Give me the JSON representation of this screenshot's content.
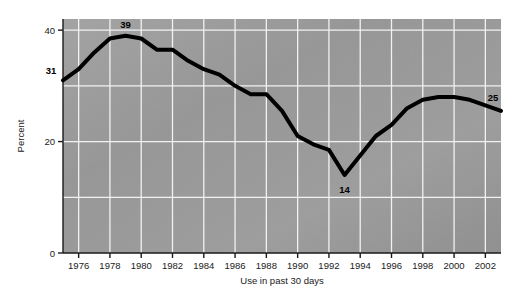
{
  "chart_data": {
    "type": "line",
    "title": "",
    "xlabel": "Use in past 30 days",
    "ylabel": "Percent",
    "xlim": [
      1975,
      2003
    ],
    "ylim": [
      0,
      42
    ],
    "ytick_labels": [
      "0",
      "20",
      "40"
    ],
    "yticks": [
      0,
      20,
      40
    ],
    "grid": true,
    "legend": false,
    "xtick_labels": [
      "1976",
      "1978",
      "1980",
      "1982",
      "1984",
      "1986",
      "1988",
      "1990",
      "1992",
      "1994",
      "1996",
      "1998",
      "2000",
      "2002"
    ],
    "xticks": [
      1976,
      1978,
      1980,
      1982,
      1984,
      1986,
      1988,
      1990,
      1992,
      1994,
      1996,
      1998,
      2000,
      2002
    ],
    "x": [
      1975,
      1976,
      1977,
      1978,
      1979,
      1980,
      1981,
      1982,
      1983,
      1984,
      1985,
      1986,
      1987,
      1988,
      1989,
      1990,
      1991,
      1992,
      1993,
      1994,
      1995,
      1996,
      1997,
      1998,
      1999,
      2000,
      2001,
      2002,
      2003
    ],
    "values": [
      31,
      33,
      36,
      38.5,
      39,
      38.5,
      36.5,
      36.5,
      34.5,
      33,
      32,
      30,
      28.5,
      28.5,
      25.5,
      21,
      19.5,
      18.5,
      14,
      17.5,
      21,
      23,
      26,
      27.5,
      28,
      28,
      27.5,
      26.5,
      25.5
    ],
    "annotations": [
      {
        "label": "31",
        "x": 1975,
        "y": 31,
        "anchor": "left-above"
      },
      {
        "label": "39",
        "x": 1979,
        "y": 39,
        "anchor": "above"
      },
      {
        "label": "14",
        "x": 1993,
        "y": 14,
        "anchor": "below"
      },
      {
        "label": "25",
        "x": 2003,
        "y": 25.5,
        "anchor": "right-above"
      }
    ],
    "line_color": "#000000",
    "line_width": 4,
    "plot_bg_color": "#9a9a9a",
    "grid_color": "#f2f2f2",
    "axis_color": "#1a1a1a"
  }
}
